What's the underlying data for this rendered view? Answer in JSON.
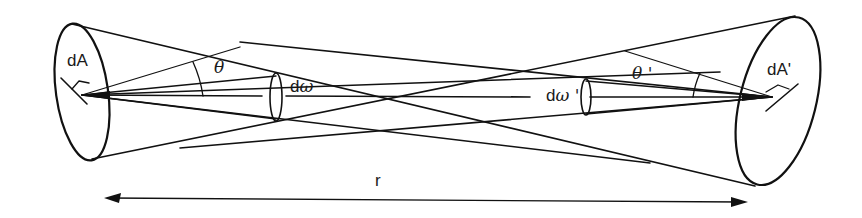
{
  "diagram": {
    "type": "radiative exchange between two surface elements",
    "colors": {
      "ink": "#111111",
      "background": "#ffffff"
    },
    "labels": {
      "left_area": "dA",
      "right_area": "dA'",
      "left_angle": "θ",
      "right_angle": "θ '",
      "left_solid_angle_d": "d",
      "left_solid_angle_symbol": "ω",
      "right_solid_angle_d": "d",
      "right_solid_angle_symbol": "ω '",
      "distance": "r"
    }
  }
}
